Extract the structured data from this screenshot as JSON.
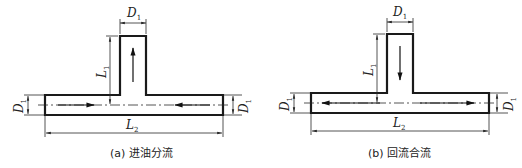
{
  "figure_a": {
    "caption": "(a) 进油分流",
    "top_width_label": "D",
    "top_width_sub": "1",
    "branch_length_label": "L",
    "branch_length_sub": "1",
    "left_diameter_label": "D",
    "left_diameter_sub": "1",
    "right_diameter_label": "D",
    "right_diameter_sub": "1",
    "main_length_label": "L",
    "main_length_sub": "2",
    "flow": "oil enters from both ends of main pipe and exits up through branch"
  },
  "figure_b": {
    "caption": "(b) 回流合流",
    "top_width_label": "D",
    "top_width_sub": "1",
    "branch_length_label": "L",
    "branch_length_sub": "1",
    "left_diameter_label": "D",
    "left_diameter_sub": "1",
    "right_diameter_label": "D",
    "right_diameter_sub": "1",
    "main_length_label": "L",
    "main_length_sub": "2",
    "flow": "return flow enters down through branch and exits through both ends"
  }
}
